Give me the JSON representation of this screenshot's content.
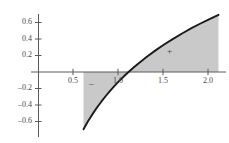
{
  "chart_data": {
    "type": "area",
    "title": "",
    "subtitle": "",
    "xlabel": "",
    "ylabel": "",
    "function": "ln(x)",
    "xlim": [
      0.37,
      2.17
    ],
    "ylim": [
      -0.78,
      0.78
    ],
    "grid": false,
    "legend": null,
    "x_ticks": [
      0.5,
      1.0,
      1.5,
      2.0
    ],
    "x_tick_labels": [
      "0.5",
      "1.0",
      "1.5",
      "2.0"
    ],
    "y_ticks": [
      -0.6,
      -0.4,
      -0.2,
      0.2,
      0.4,
      0.6
    ],
    "y_tick_labels": [
      "–0.6",
      "–0.4",
      "–0.2",
      "0.2",
      "0.4",
      "0.6"
    ],
    "series": [
      {
        "name": "ln(x)",
        "color": "#1a1a1a",
        "x": [
          0.5,
          0.55,
          0.6,
          0.65,
          0.7,
          0.75,
          0.8,
          0.85,
          0.9,
          0.95,
          1.0,
          1.05,
          1.1,
          1.2,
          1.3,
          1.4,
          1.5,
          1.6,
          1.7,
          1.8,
          1.9,
          2.0
        ],
        "values": [
          -0.693,
          -0.598,
          -0.511,
          -0.431,
          -0.357,
          -0.288,
          -0.223,
          -0.163,
          -0.105,
          -0.051,
          0.0,
          0.049,
          0.095,
          0.182,
          0.262,
          0.336,
          0.405,
          0.47,
          0.531,
          0.588,
          0.642,
          0.693
        ]
      }
    ],
    "shaded_regions": [
      {
        "name": "negative-area",
        "x_from": 0.5,
        "x_to": 1.0,
        "sign_label": "–",
        "sign_x": 0.72,
        "sign_y": -0.12,
        "fill": "#c9c9c9"
      },
      {
        "name": "positive-area",
        "x_from": 1.0,
        "x_to": 2.0,
        "sign_label": "+",
        "sign_x": 1.66,
        "sign_y": 0.28,
        "fill": "#c9c9c9"
      }
    ],
    "axis_color": "#555555",
    "curve_color": "#1a1a1a",
    "shade_color": "#c9c9c9",
    "background": "#ffffff"
  },
  "axes": {
    "y_labels": [
      "0.6",
      "0.4",
      "0.2",
      "–0.2",
      "–0.4",
      "–0.6"
    ],
    "x_labels": [
      "0.5",
      "1.0",
      "1.5",
      "2.0"
    ]
  },
  "annotations": {
    "minus_sign": "–",
    "plus_sign": "+"
  }
}
